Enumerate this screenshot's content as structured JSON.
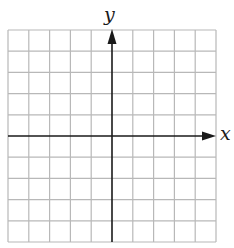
{
  "diagram": {
    "type": "coordinate-plane",
    "grid": {
      "columns": 10,
      "rows": 10
    },
    "axes": {
      "x_label": "x",
      "y_label": "y"
    },
    "colors": {
      "grid": "#b8b8b8",
      "axis": "#1a1a1a"
    }
  }
}
